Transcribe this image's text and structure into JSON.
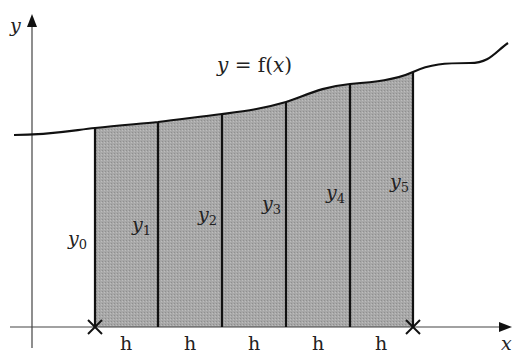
{
  "diagram": {
    "type": "trapezoidal-rule-illustration",
    "axes": {
      "x_label": "x",
      "y_label": "y"
    },
    "curve_label": {
      "lhs": "y",
      "eq": " = f(",
      "var": "x",
      "close": ")"
    },
    "ordinates": [
      {
        "base": "y",
        "sub": "0"
      },
      {
        "base": "y",
        "sub": "1"
      },
      {
        "base": "y",
        "sub": "2"
      },
      {
        "base": "y",
        "sub": "3"
      },
      {
        "base": "y",
        "sub": "4"
      },
      {
        "base": "y",
        "sub": "5"
      }
    ],
    "intervals": [
      "h",
      "h",
      "h",
      "h",
      "h"
    ],
    "endpoint_markers": [
      "cross",
      "cross"
    ],
    "colors": {
      "fill": "#a6a6a6",
      "stroke": "#1a1a1a",
      "axis": "#444444"
    }
  }
}
